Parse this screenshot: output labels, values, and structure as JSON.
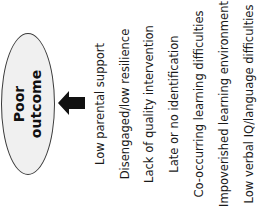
{
  "diagram": {
    "orientation": "rotated-90-ccw",
    "outcome": {
      "lines": [
        "Poor",
        "outcome"
      ],
      "fill": "#f0f0f0",
      "border": "#3a3a3a"
    },
    "arrow": {
      "direction": "toward-outcome",
      "color": "#111111"
    },
    "factors": [
      {
        "label": "Low parental support",
        "x": 100
      },
      {
        "label": "Disengaged/low resilience",
        "x": 125
      },
      {
        "label": "Lack of quality intervention",
        "x": 149
      },
      {
        "label": "Late or no identification",
        "x": 174
      },
      {
        "label": "Co-occurring learning difficulties",
        "x": 199
      },
      {
        "label": "Impoverished learning environment",
        "x": 224
      },
      {
        "label": "Low verbal IQ/language difficulties",
        "x": 249
      }
    ]
  }
}
